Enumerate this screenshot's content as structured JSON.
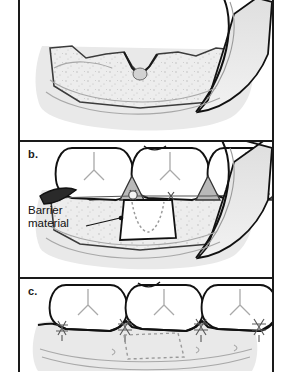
{
  "figure": {
    "type": "medical-illustration",
    "panel_count": 3,
    "frame_color": "#1a1a1a",
    "background": "#ffffff"
  },
  "palette": {
    "outline": "#111111",
    "tissue_fill": "#e9e9e9",
    "tissue_edge": "#bdbdbd",
    "papilla_fill": "#b9b9b9",
    "bone_fill": "#ededed",
    "tooth_fill": "#ffffff",
    "membrane_fill": "#ffffff",
    "dotted_defect": "#9a9a9a",
    "flap_shadow": "#d6d6d6",
    "suture_gray": "#6e6e6e",
    "text": "#111111"
  },
  "panels": [
    {
      "id": "panel-a",
      "label": "",
      "label_visible": false,
      "cropped_top": true,
      "caption_semantics": "Full-thickness flap reflected exposing the interproximal intrabony defect",
      "elements": [
        "three molar teeth",
        "gray interdental papillae",
        "alveolar bone crest with stippled texture",
        "intrabony defect crater",
        "reflected mucoperiosteal flap at left",
        "reflected mucoperiosteal flap at right"
      ]
    },
    {
      "id": "panel-b",
      "label": "b.",
      "label_visible": true,
      "caption_semantics": "Barrier membrane adapted over the defect and secured with a sling suture",
      "elements": [
        "three molar teeth",
        "barrier membrane trapezoid",
        "dotted outline of underlying bone defect",
        "sling suture knot at membrane crest",
        "reflected flap at right",
        "leader line from label to membrane"
      ],
      "callouts": [
        {
          "name": "barrier-material-label",
          "line1": "Barrier",
          "line2": "material"
        }
      ]
    },
    {
      "id": "panel-c",
      "label": "c.",
      "label_visible": true,
      "caption_semantics": "Flap repositioned coronally and closed with interrupted interproximal sutures",
      "elements": [
        "three molar teeth",
        "repositioned gingival flap",
        "four interproximal suture knots",
        "dotted outline of membrane position beneath tissue"
      ],
      "suture_count": 4
    }
  ]
}
